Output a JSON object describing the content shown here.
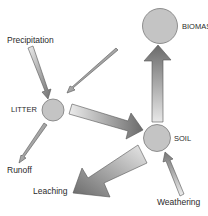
{
  "diagram": {
    "nodes": [
      {
        "id": "biomass",
        "label": "BIOMASS"
      },
      {
        "id": "litter",
        "label": "LITTER"
      },
      {
        "id": "soil",
        "label": "SOIL"
      }
    ],
    "sources_sinks": {
      "precipitation": "Precipitation",
      "runoff": "Runoff",
      "leaching": "Leaching",
      "weathering": "Weathering"
    },
    "flows": [
      {
        "from": "Precipitation",
        "to": "LITTER",
        "size": "medium"
      },
      {
        "from": "BIOMASS",
        "to": "LITTER",
        "size": "thin"
      },
      {
        "from": "LITTER",
        "to": "Runoff",
        "size": "thin"
      },
      {
        "from": "LITTER",
        "to": "SOIL",
        "size": "large"
      },
      {
        "from": "SOIL",
        "to": "BIOMASS",
        "size": "large"
      },
      {
        "from": "SOIL",
        "to": "Leaching",
        "size": "very large"
      },
      {
        "from": "Weathering",
        "to": "SOIL",
        "size": "medium"
      }
    ],
    "colors": {
      "node_fill": "#c4c4c4",
      "node_stroke": "#7a7a7a",
      "arrow_dark": "#6e6e6e",
      "arrow_light": "#e6e6e6"
    }
  }
}
